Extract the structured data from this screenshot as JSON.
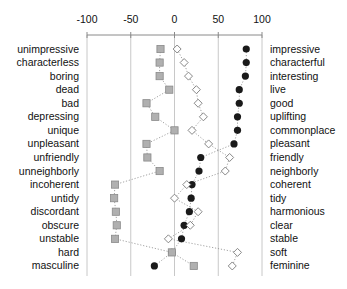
{
  "chart_data": {
    "type": "scatter",
    "title": "",
    "xlabel": "",
    "ylabel": "",
    "xlim": [
      -100,
      100
    ],
    "x_ticks": [
      -100,
      -50,
      0,
      50,
      100
    ],
    "x_tick_labels": [
      "-100",
      "-50",
      "0",
      "50",
      "100"
    ],
    "grid": true,
    "legend": "none",
    "left_labels": [
      "unimpressive",
      "characterless",
      "boring",
      "dead",
      "bad",
      "depressing",
      "unique",
      "unpleasant",
      "unfriendly",
      "unneighborly",
      "incoherent",
      "untidy",
      "discordant",
      "obscure",
      "unstable",
      "hard",
      "masculine"
    ],
    "right_labels": [
      "impressive",
      "characterful",
      "interesting",
      "live",
      "good",
      "uplifting",
      "commonplace",
      "pleasant",
      "friendly",
      "neighborly",
      "coherent",
      "tidy",
      "harmonious",
      "clear",
      "stable",
      "soft",
      "feminine"
    ],
    "series": [
      {
        "name": "filled-circle",
        "marker": "circle",
        "color": "#1a1a1a",
        "values": [
          82,
          82,
          81,
          74,
          74,
          72,
          72,
          68,
          30,
          28,
          20,
          19,
          17,
          11,
          8,
          -3,
          -23
        ]
      },
      {
        "name": "gray-square",
        "marker": "square",
        "color": "#b0b0b0",
        "values": [
          -16,
          -17,
          -17,
          -6,
          -32,
          -22,
          0,
          -32,
          -31,
          -17,
          -68,
          -69,
          -67,
          -66,
          -68,
          -3,
          22
        ]
      },
      {
        "name": "open-diamond",
        "marker": "diamond",
        "color": "#ffffff",
        "values": [
          3,
          11,
          16,
          25,
          27,
          33,
          20,
          39,
          63,
          58,
          14,
          0,
          27,
          18,
          -7,
          72,
          66
        ]
      }
    ]
  }
}
